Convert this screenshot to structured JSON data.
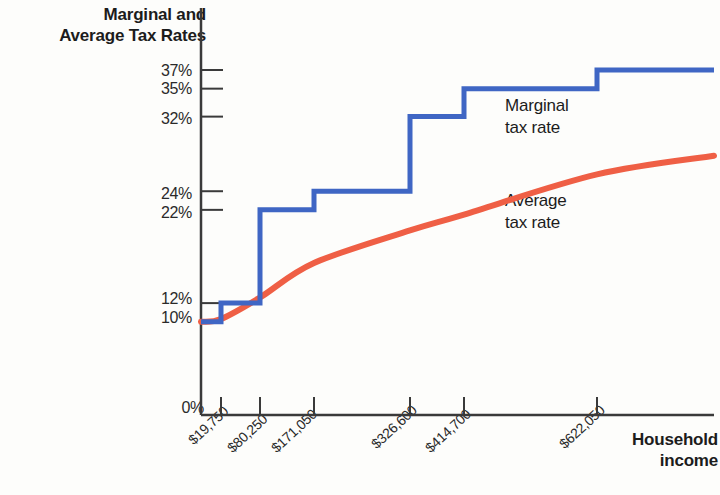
{
  "chart_data": {
    "type": "line",
    "title": "",
    "xlabel": "Household income",
    "ylabel": "Marginal and Average Tax Rates",
    "grid": false,
    "legend_position": "inline-annotations",
    "x_tick_labels": [
      "$19,750",
      "$80,250",
      "$171,050",
      "$326,600",
      "$414,700",
      "$622,050"
    ],
    "x_tick_values": [
      19750,
      80250,
      171050,
      326600,
      414700,
      622050
    ],
    "y_tick_labels": [
      "0%",
      "10%",
      "12%",
      "22%",
      "24%",
      "32%",
      "35%",
      "37%"
    ],
    "y_tick_values": [
      0,
      10,
      12,
      22,
      24,
      32,
      35,
      37
    ],
    "ylim": [
      0,
      39
    ],
    "series": [
      {
        "name": "Marginal tax rate",
        "style": "step",
        "color": "#3f66c4",
        "breakpoints": [
          19750,
          80250,
          171050,
          326600,
          414700,
          622050
        ],
        "values": [
          10,
          12,
          22,
          24,
          32,
          35,
          37
        ]
      },
      {
        "name": "Average tax rate",
        "style": "smooth-curve",
        "color": "#ef5f45",
        "x": [
          0,
          19750,
          80250,
          171050,
          326600,
          414700,
          622050,
          760000
        ],
        "values": [
          10.0,
          10.3,
          12.6,
          16.3,
          19.8,
          21.5,
          25.8,
          27.8
        ]
      }
    ],
    "annotations": [
      {
        "text_line1": "Marginal",
        "text_line2": "tax rate"
      },
      {
        "text_line1": "Average",
        "text_line2": "tax rate"
      }
    ]
  },
  "axes": {
    "y_title_line1": "Marginal and",
    "y_title_line2": "Average Tax Rates",
    "x_title_line1": "Household",
    "x_title_line2": "income"
  },
  "ticks": {
    "y": [
      {
        "label": "37%"
      },
      {
        "label": "35%"
      },
      {
        "label": "32%"
      },
      {
        "label": "24%"
      },
      {
        "label": "22%"
      },
      {
        "label": "12%"
      },
      {
        "label": "10%"
      },
      {
        "label": "0%"
      }
    ],
    "x": [
      {
        "label": "$19,750"
      },
      {
        "label": "$80,250"
      },
      {
        "label": "$171,050"
      },
      {
        "label": "$326,600"
      },
      {
        "label": "$414,700"
      },
      {
        "label": "$622,050"
      }
    ]
  },
  "annotations": {
    "marginal_line1": "Marginal",
    "marginal_line2": "tax rate",
    "average_line1": "Average",
    "average_line2": "tax rate"
  },
  "colors": {
    "marginal": "#3f66c4",
    "average": "#ef5f45",
    "axis": "#3a3a3a",
    "text": "#1c1c1c"
  }
}
